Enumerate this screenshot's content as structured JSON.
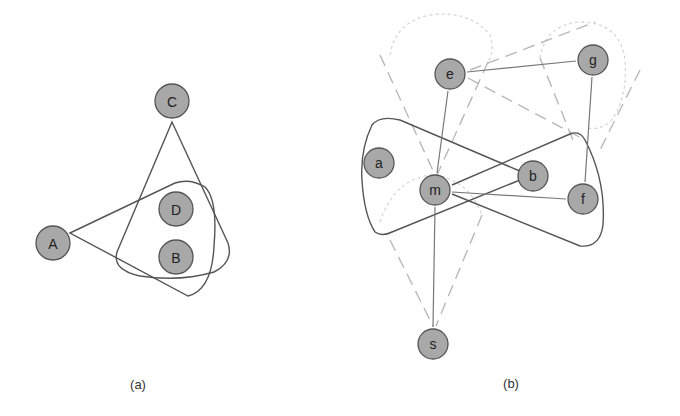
{
  "panels": [
    {
      "id": "a",
      "caption": "(a)",
      "nodes": [
        {
          "label": "C",
          "x": 172,
          "y": 101
        },
        {
          "label": "D",
          "x": 176,
          "y": 209
        },
        {
          "label": "B",
          "x": 176,
          "y": 257
        },
        {
          "label": "A",
          "x": 53,
          "y": 243
        }
      ],
      "hyperedges": [
        {
          "from": "C",
          "contains": [
            "D",
            "B"
          ],
          "style": "solid"
        },
        {
          "from": "A",
          "contains": [
            "D",
            "B"
          ],
          "style": "solid"
        }
      ]
    },
    {
      "id": "b",
      "caption": "(b)",
      "nodes": [
        {
          "label": "e",
          "x": 450,
          "y": 74
        },
        {
          "label": "g",
          "x": 593,
          "y": 60
        },
        {
          "label": "a",
          "x": 379,
          "y": 163
        },
        {
          "label": "m",
          "x": 435,
          "y": 190
        },
        {
          "label": "b",
          "x": 533,
          "y": 176
        },
        {
          "label": "f",
          "x": 583,
          "y": 199
        },
        {
          "label": "s",
          "x": 433,
          "y": 344
        }
      ],
      "edges": [
        [
          "e",
          "g"
        ],
        [
          "e",
          "m"
        ],
        [
          "g",
          "f"
        ],
        [
          "m",
          "f"
        ],
        [
          "m",
          "s"
        ]
      ],
      "hyperedges": [
        {
          "from": "m",
          "contains": [
            "b",
            "f"
          ],
          "style": "solid"
        },
        {
          "from": "b",
          "contains": [
            "a",
            "m"
          ],
          "style": "solid"
        },
        {
          "from": "e",
          "contains": [
            "m"
          ],
          "style": "dashed"
        },
        {
          "from": "g",
          "contains": [
            "e"
          ],
          "style": "dashed"
        },
        {
          "from": "e",
          "contains": [
            "g",
            "f"
          ],
          "style": "dashed"
        },
        {
          "from": "s",
          "contains": [
            "m"
          ],
          "style": "dashed"
        }
      ]
    }
  ]
}
